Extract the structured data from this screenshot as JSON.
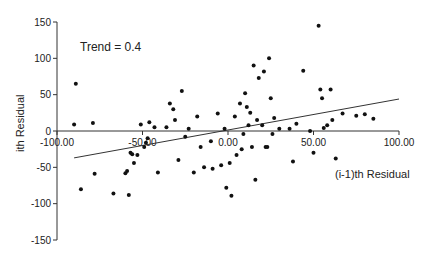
{
  "chart_data": {
    "type": "scatter",
    "title": "",
    "annotation": "Trend = 0.4",
    "xlabel": "(i-1)th Residual",
    "ylabel": "ith Residual",
    "xlim": [
      -100,
      100
    ],
    "ylim": [
      -150,
      150
    ],
    "xticks": [
      "-100.00",
      "-50.00",
      "0.00",
      "50.00",
      "100.00"
    ],
    "yticks": [
      "150",
      "100",
      "50",
      "0",
      "-50",
      "-100",
      "-150"
    ],
    "grid": false,
    "legend": null,
    "trend_line": {
      "x": [
        -90,
        100
      ],
      "y": [
        -37,
        44
      ],
      "slope": 0.4
    },
    "points": [
      {
        "x": -90,
        "y": 9
      },
      {
        "x": -89,
        "y": 65
      },
      {
        "x": -86,
        "y": -80
      },
      {
        "x": -79,
        "y": 11
      },
      {
        "x": -78,
        "y": -59
      },
      {
        "x": -67,
        "y": -86
      },
      {
        "x": -60,
        "y": -58
      },
      {
        "x": -59,
        "y": -55
      },
      {
        "x": -58,
        "y": -88
      },
      {
        "x": -57,
        "y": -30
      },
      {
        "x": -56,
        "y": -32
      },
      {
        "x": -55,
        "y": -44
      },
      {
        "x": -53,
        "y": -33
      },
      {
        "x": -51,
        "y": 9
      },
      {
        "x": -49,
        "y": -22
      },
      {
        "x": -48,
        "y": -16
      },
      {
        "x": -47,
        "y": -10
      },
      {
        "x": -46,
        "y": 12
      },
      {
        "x": -43,
        "y": 5
      },
      {
        "x": -41,
        "y": -57
      },
      {
        "x": -36,
        "y": 5
      },
      {
        "x": -34,
        "y": 38
      },
      {
        "x": -32,
        "y": 30
      },
      {
        "x": -31,
        "y": 15
      },
      {
        "x": -29,
        "y": -40
      },
      {
        "x": -27,
        "y": 55
      },
      {
        "x": -25,
        "y": -8
      },
      {
        "x": -23,
        "y": 3
      },
      {
        "x": -20,
        "y": -57
      },
      {
        "x": -18,
        "y": 20
      },
      {
        "x": -16,
        "y": -22
      },
      {
        "x": -14,
        "y": -50
      },
      {
        "x": -10,
        "y": -14
      },
      {
        "x": -9,
        "y": -52
      },
      {
        "x": -6,
        "y": 24
      },
      {
        "x": -4,
        "y": -47
      },
      {
        "x": -2,
        "y": 3
      },
      {
        "x": -1,
        "y": -78
      },
      {
        "x": 1,
        "y": -44
      },
      {
        "x": 2,
        "y": -89
      },
      {
        "x": 4,
        "y": 20
      },
      {
        "x": 5,
        "y": -33
      },
      {
        "x": 7,
        "y": 38
      },
      {
        "x": 8,
        "y": -25
      },
      {
        "x": 9,
        "y": -4
      },
      {
        "x": 10,
        "y": 52
      },
      {
        "x": 11,
        "y": 33
      },
      {
        "x": 12,
        "y": 8
      },
      {
        "x": 13,
        "y": 25
      },
      {
        "x": 14,
        "y": -22
      },
      {
        "x": 15,
        "y": 90
      },
      {
        "x": 16,
        "y": -67
      },
      {
        "x": 17,
        "y": 15
      },
      {
        "x": 18,
        "y": 73
      },
      {
        "x": 20,
        "y": 8
      },
      {
        "x": 21,
        "y": 82
      },
      {
        "x": 22,
        "y": -22
      },
      {
        "x": 23,
        "y": -22
      },
      {
        "x": 24,
        "y": 100
      },
      {
        "x": 25,
        "y": 45
      },
      {
        "x": 26,
        "y": -4
      },
      {
        "x": 27,
        "y": 18
      },
      {
        "x": 30,
        "y": 3
      },
      {
        "x": 36,
        "y": 3
      },
      {
        "x": 38,
        "y": -42
      },
      {
        "x": 40,
        "y": 10
      },
      {
        "x": 44,
        "y": 83
      },
      {
        "x": 48,
        "y": 0
      },
      {
        "x": 50,
        "y": -30
      },
      {
        "x": 53,
        "y": 145
      },
      {
        "x": 54,
        "y": 57
      },
      {
        "x": 55,
        "y": 45
      },
      {
        "x": 56,
        "y": 4
      },
      {
        "x": 58,
        "y": 8
      },
      {
        "x": 60,
        "y": 57
      },
      {
        "x": 61,
        "y": 15
      },
      {
        "x": 63,
        "y": -38
      },
      {
        "x": 67,
        "y": 24
      },
      {
        "x": 75,
        "y": 21
      },
      {
        "x": 80,
        "y": 23
      },
      {
        "x": 85,
        "y": 17
      }
    ]
  },
  "layout": {
    "plot": {
      "x0": 57,
      "x1": 399,
      "y0": 22,
      "y1": 240,
      "zero_x": 227,
      "zero_y": 131
    },
    "colors": {
      "axis": "#333333",
      "point": "#111111",
      "trend": "#333333",
      "text": "#222222"
    }
  }
}
